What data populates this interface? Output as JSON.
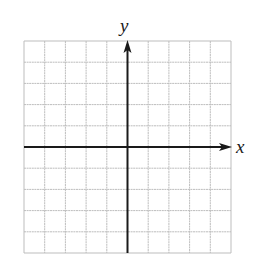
{
  "diagram": {
    "type": "coordinate-grid",
    "x_axis_label": "x",
    "y_axis_label": "y",
    "grid": {
      "columns": 10,
      "rows": 10,
      "left": 24,
      "top": 41,
      "right": 231,
      "bottom": 253,
      "origin_col": 5,
      "origin_row": 5
    },
    "colors": {
      "grid_line": "#bdbdbd",
      "axis": "#1a1a1a",
      "background": "#ffffff"
    }
  }
}
